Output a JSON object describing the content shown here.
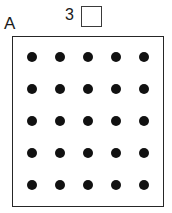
{
  "worksheet": {
    "section_label": "A",
    "problem_number": "3",
    "answer_box": {
      "value": "",
      "placeholder": ""
    },
    "dot_array": {
      "rows": 5,
      "columns": 5,
      "total_dots": 25,
      "dot_color": "#111111",
      "frame_color": "#262626",
      "background_color": "#ffffff",
      "cells": [
        [
          "dot",
          "dot",
          "dot",
          "dot",
          "dot"
        ],
        [
          "dot",
          "dot",
          "dot",
          "dot",
          "dot"
        ],
        [
          "dot",
          "dot",
          "dot",
          "dot",
          "dot"
        ],
        [
          "dot",
          "dot",
          "dot",
          "dot",
          "dot"
        ],
        [
          "dot",
          "dot",
          "dot",
          "dot",
          "dot"
        ]
      ]
    }
  }
}
